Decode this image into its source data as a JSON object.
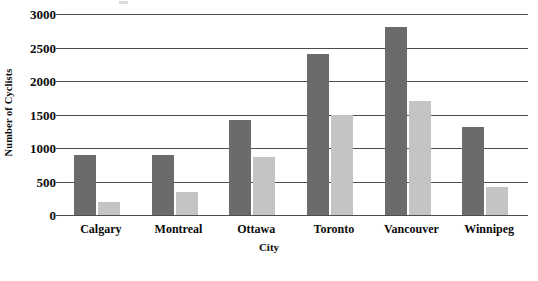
{
  "chart_data": {
    "type": "bar",
    "title": "",
    "xlabel": "City",
    "ylabel": "Number of Cyclists",
    "categories": [
      "Calgary",
      "Montreal",
      "Ottawa",
      "Toronto",
      "Vancouver",
      "Winnipeg"
    ],
    "series": [
      {
        "name": "series-1",
        "color": "#6b6b6b",
        "values": [
          900,
          900,
          1420,
          2400,
          2800,
          1320
        ]
      },
      {
        "name": "series-2",
        "color": "#c4c4c4",
        "values": [
          200,
          350,
          870,
          1500,
          1700,
          420
        ]
      }
    ],
    "ylim": [
      0,
      3000
    ],
    "y_ticks": [
      0,
      500,
      1000,
      1500,
      2000,
      2500,
      3000
    ],
    "y_tick_labels": [
      "0",
      "500",
      "1000",
      "1500",
      "2000",
      "2500",
      "3000"
    ],
    "grid": true,
    "legend": "none",
    "gridline_color": "#4d4d4d",
    "background": "#ffffff"
  }
}
